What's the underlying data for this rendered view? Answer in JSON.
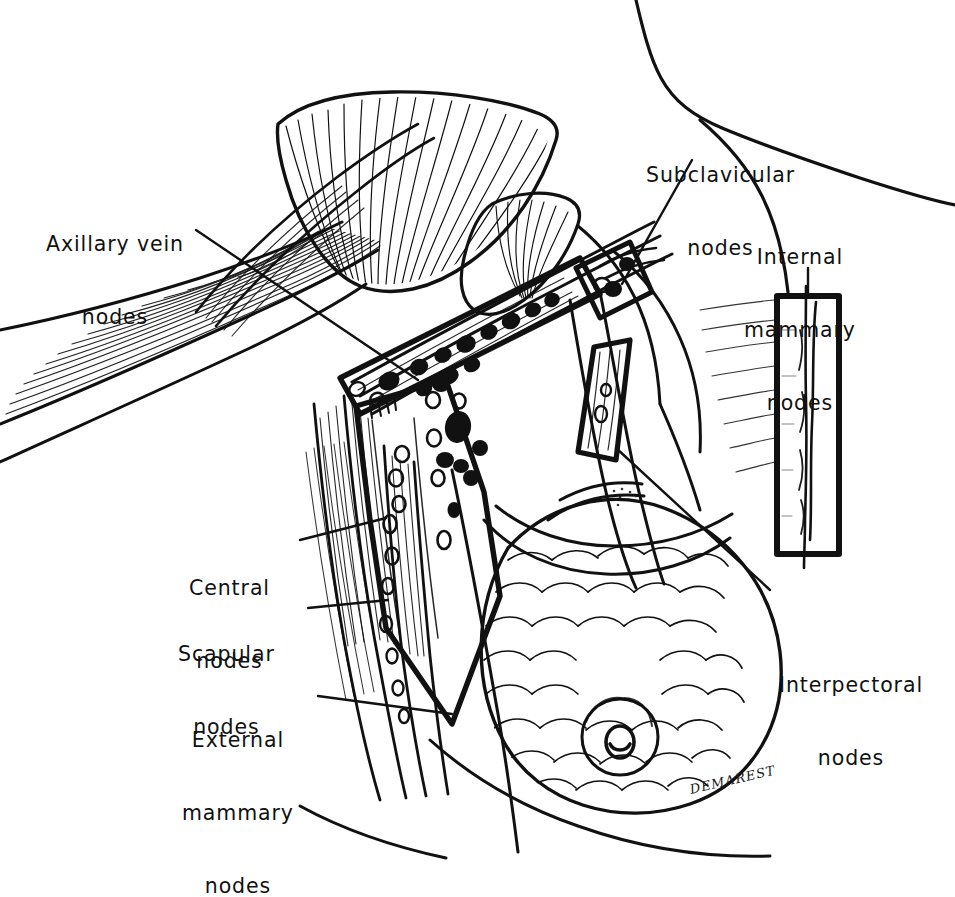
{
  "figure": {
    "kind": "anatomical line illustration",
    "background_color": "#ffffff",
    "ink_color": "#111111",
    "signature": "DEMAREST"
  },
  "labels": {
    "axillary_vein": {
      "line1": "Axillary vein",
      "line2": "nodes"
    },
    "subclavicular": {
      "line1": "Subclavicular",
      "line2": "nodes"
    },
    "internal_mammary": {
      "line1": "Internal",
      "line2": "mammary",
      "line3": "nodes"
    },
    "interpectoral": {
      "line1": "Interpectoral",
      "line2": "nodes"
    },
    "central": {
      "line1": "Central",
      "line2": "nodes"
    },
    "scapular": {
      "line1": "Scapular",
      "line2": "nodes"
    },
    "external_mammary": {
      "line1": "External",
      "line2": "mammary",
      "line3": "nodes"
    }
  },
  "node_groups": [
    {
      "name": "axillary-vein-nodes",
      "style": "filled",
      "count": 11
    },
    {
      "name": "subclavicular-nodes",
      "style": "filled",
      "count": 3
    },
    {
      "name": "interpectoral-nodes",
      "style": "outlined",
      "count": 2
    },
    {
      "name": "central-nodes",
      "style": "mixed",
      "count": 12
    },
    {
      "name": "scapular-nodes",
      "style": "outlined",
      "count": 6
    },
    {
      "name": "external-mammary-nodes",
      "style": "outlined",
      "count": 5
    },
    {
      "name": "internal-mammary-nodes",
      "style": "chain",
      "count": 1
    }
  ],
  "callout_boxes": [
    {
      "name": "axillary-vein-box",
      "orientation": "oblique"
    },
    {
      "name": "interpectoral-box",
      "orientation": "oblique-vertical"
    },
    {
      "name": "internal-mammary-box",
      "orientation": "vertical"
    },
    {
      "name": "central-scapular-polygon",
      "orientation": "polygon"
    }
  ]
}
